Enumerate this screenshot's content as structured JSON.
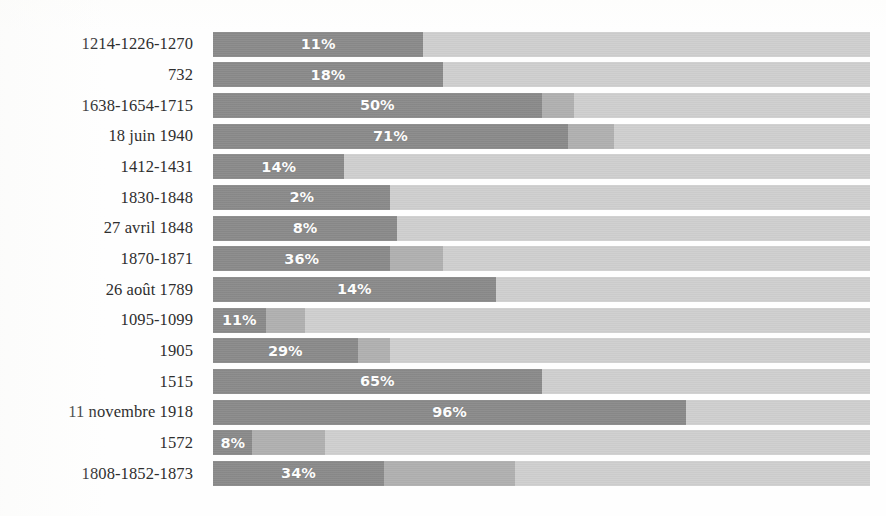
{
  "chart_data": {
    "type": "bar",
    "subtype": "stacked-horizontal-100",
    "title": "",
    "subtitle": "",
    "xlabel": "",
    "ylabel": "",
    "xlim": [
      0,
      100
    ],
    "grid": false,
    "legend_position": "none",
    "orientation": "horizontal",
    "stacked": true,
    "value_label_suffix": "%",
    "categories": [
      "1214-1226-1270",
      "732",
      "1638-1654-1715",
      "18 juin 1940",
      "1412-1431",
      "1830-1848",
      "27 avril 1848",
      "1870-1871",
      "26 août 1789",
      "1095-1099",
      "1905",
      "1515",
      "11 novembre 1918",
      "1572",
      "1808-1852-1873"
    ],
    "series": [
      {
        "name": "series-a",
        "color": "#8a8a8a",
        "values": [
          32,
          35,
          50,
          54,
          20,
          27,
          28,
          27,
          43,
          8,
          22,
          50,
          72,
          6,
          26
        ]
      },
      {
        "name": "series-b",
        "color": "#b0b0b0",
        "values": [
          0,
          0,
          5,
          7,
          0,
          0,
          0,
          8,
          0,
          6,
          5,
          0,
          0,
          11,
          20
        ]
      },
      {
        "name": "series-c",
        "color": "#cfcfcf",
        "values": [
          68,
          65,
          45,
          39,
          80,
          73,
          72,
          65,
          57,
          86,
          73,
          50,
          28,
          83,
          54
        ]
      }
    ],
    "value_labels": [
      "11%",
      "18%",
      "50%",
      "71%",
      "14%",
      "2%",
      "8%",
      "36%",
      "14%",
      "11%",
      "29%",
      "65%",
      "96%",
      "8%",
      "34%"
    ],
    "value_numeric": [
      11,
      18,
      50,
      71,
      14,
      2,
      8,
      36,
      14,
      11,
      29,
      65,
      96,
      8,
      34
    ]
  }
}
